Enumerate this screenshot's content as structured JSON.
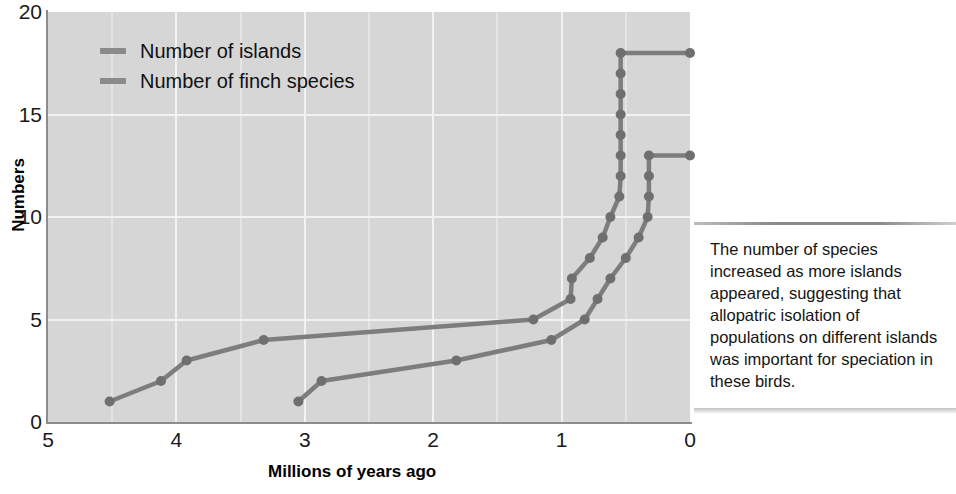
{
  "chart_data": {
    "type": "line",
    "title": "",
    "xlabel": "Millions of years ago",
    "ylabel": "Numbers",
    "xlim": [
      5,
      0
    ],
    "ylim": [
      0,
      20
    ],
    "x_reversed": true,
    "grid": true,
    "legend_position": "top-left",
    "xticks": [
      "5",
      "4",
      "3",
      "2",
      "1",
      "0"
    ],
    "xtick_values": [
      5,
      4,
      3,
      2,
      1,
      0
    ],
    "yticks": [
      "0",
      "5",
      "10",
      "15",
      "20"
    ],
    "ytick_values": [
      0,
      5,
      10,
      15,
      20
    ],
    "series": [
      {
        "name": "Number of islands",
        "color": "#7d7d7d",
        "points": [
          {
            "x": 4.52,
            "y": 1
          },
          {
            "x": 4.12,
            "y": 2
          },
          {
            "x": 3.92,
            "y": 3
          },
          {
            "x": 3.32,
            "y": 4
          },
          {
            "x": 1.22,
            "y": 5
          },
          {
            "x": 0.93,
            "y": 6
          },
          {
            "x": 0.92,
            "y": 7
          },
          {
            "x": 0.78,
            "y": 8
          },
          {
            "x": 0.68,
            "y": 9
          },
          {
            "x": 0.62,
            "y": 10
          },
          {
            "x": 0.55,
            "y": 11
          },
          {
            "x": 0.54,
            "y": 12
          },
          {
            "x": 0.54,
            "y": 13
          },
          {
            "x": 0.54,
            "y": 14
          },
          {
            "x": 0.54,
            "y": 15
          },
          {
            "x": 0.54,
            "y": 16
          },
          {
            "x": 0.54,
            "y": 17
          },
          {
            "x": 0.54,
            "y": 18
          },
          {
            "x": 0.0,
            "y": 18
          }
        ]
      },
      {
        "name": "Number of finch species",
        "color": "#7d7d7d",
        "points": [
          {
            "x": 3.05,
            "y": 1
          },
          {
            "x": 2.87,
            "y": 2
          },
          {
            "x": 1.82,
            "y": 3
          },
          {
            "x": 1.08,
            "y": 4
          },
          {
            "x": 0.82,
            "y": 5
          },
          {
            "x": 0.72,
            "y": 6
          },
          {
            "x": 0.62,
            "y": 7
          },
          {
            "x": 0.5,
            "y": 8
          },
          {
            "x": 0.4,
            "y": 9
          },
          {
            "x": 0.33,
            "y": 10
          },
          {
            "x": 0.32,
            "y": 11
          },
          {
            "x": 0.32,
            "y": 12
          },
          {
            "x": 0.32,
            "y": 13
          },
          {
            "x": 0.0,
            "y": 13
          }
        ]
      }
    ]
  },
  "legend": {
    "items": [
      {
        "label": "Number of islands",
        "color": "#8a8a8a"
      },
      {
        "label": "Number of finch species",
        "color": "#8a8a8a"
      }
    ]
  },
  "axes": {
    "y_title": "Numbers",
    "x_title": "Millions of years ago"
  },
  "caption": {
    "text": "The number of species increased as more islands appeared, suggesting that allopatric isolation of populations on different islands was important for speciation in these birds."
  },
  "style": {
    "plot_background": "#d6d6d6",
    "page_background": "#ffffff",
    "gridline_color": "#f2f2f2",
    "axis_color": "#8d8d8d",
    "line_color": "#7d7d7d",
    "marker_color": "#6f6f6f",
    "text_color": "#141414"
  }
}
